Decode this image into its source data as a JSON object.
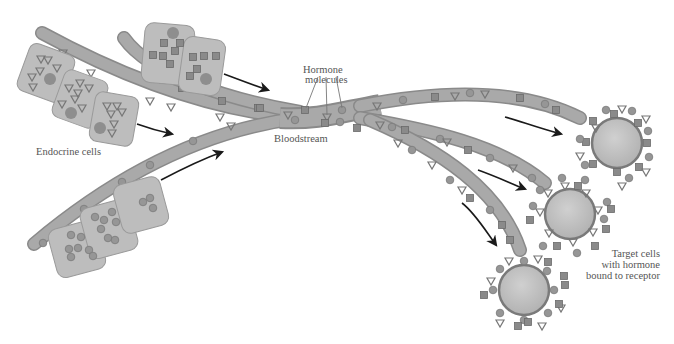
{
  "labels": {
    "endocrine_cells": "Endocrine cells",
    "hormone_molecules_line1": "Hormone",
    "hormone_molecules_line2": "molecules",
    "bloodstream": "Bloodstream",
    "target_cells_line1": "Target cells",
    "target_cells_line2": "with hormone",
    "target_cells_line3": "bound to receptor"
  },
  "colors": {
    "vessel_fill": "#a9a9a9",
    "vessel_stroke": "#8a8a8a",
    "cell_fill": "#bdbdbd",
    "cell_stroke": "#9a9a9a",
    "nucleus": "#8e8e8e",
    "molecule": "#7a7a7a",
    "target_cell": "#c4c4c4",
    "arrow": "#1a1a1a",
    "label_text": "#555555"
  },
  "hormone_types": [
    "triangle",
    "square",
    "circle"
  ],
  "endocrine_groups": [
    {
      "name": "triangle-secreting cells",
      "count": 3
    },
    {
      "name": "square-secreting cells",
      "count": 2
    },
    {
      "name": "circle-secreting cells",
      "count": 3
    }
  ],
  "target_cells": {
    "count": 3
  }
}
